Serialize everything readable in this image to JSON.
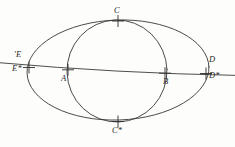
{
  "figure": {
    "background_color": "#fdfdfc",
    "stroke_color": "#3a3a3a",
    "width": 235,
    "height": 147,
    "curves": [
      {
        "name": "outer-ellipse",
        "type": "ellipse",
        "cx": 118,
        "cy": 70,
        "rx": 91,
        "ry": 50,
        "rotation": -2
      },
      {
        "name": "inner-ellipse",
        "type": "ellipse",
        "cx": 117,
        "cy": 71,
        "rx": 50,
        "ry": 51,
        "rotation": -2
      }
    ],
    "axis": {
      "name": "transversal-line",
      "x1": 0,
      "y1": 63,
      "x2": 235,
      "y2": 75
    },
    "points": [
      {
        "id": "C",
        "label": "C",
        "x": 118,
        "y": 21,
        "label_x": 114,
        "label_y": 6,
        "marker": "cross"
      },
      {
        "id": "Eprime",
        "label": "'E",
        "x": 28,
        "y": 59,
        "label_x": 14,
        "label_y": 51,
        "marker": "none"
      },
      {
        "id": "D",
        "label": "D",
        "x": 205,
        "y": 64,
        "label_x": 209,
        "label_y": 56,
        "marker": "none"
      },
      {
        "id": "Estar",
        "label": "E*",
        "x": 29,
        "y": 68,
        "label_x": 12,
        "label_y": 65,
        "marker": "cross"
      },
      {
        "id": "A",
        "label": "A",
        "x": 68,
        "y": 70,
        "label_x": 61,
        "label_y": 74,
        "marker": "cross"
      },
      {
        "id": "B",
        "label": "B",
        "x": 165,
        "y": 73,
        "label_x": 163,
        "label_y": 77,
        "marker": "cross"
      },
      {
        "id": "Dstar",
        "label": "D*",
        "x": 206,
        "y": 73,
        "label_x": 209,
        "label_y": 71,
        "marker": "cross"
      },
      {
        "id": "Cstar",
        "label": "C*",
        "x": 118,
        "y": 122,
        "label_x": 112,
        "label_y": 126,
        "marker": "cross"
      }
    ]
  }
}
